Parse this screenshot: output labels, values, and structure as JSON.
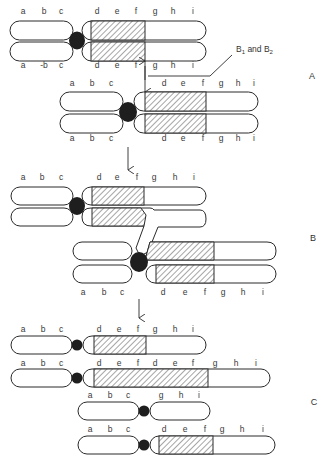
{
  "figure": {
    "sections": [
      {
        "id": "A",
        "label": "A",
        "x": 312,
        "y": 76
      },
      {
        "id": "B",
        "label": "B",
        "x": 313,
        "y": 238
      },
      {
        "id": "C",
        "label": "C",
        "x": 314,
        "y": 402
      }
    ],
    "callout": {
      "text": "B",
      "sub1": "1",
      "mid": " and B",
      "sub2": "2"
    },
    "colors": {
      "outline": "#2a2a2a",
      "centromere": "#1e1e1e",
      "background": "#ffffff",
      "text": "#3a3a3a"
    },
    "gene_rows": [
      {
        "name": "A-top-upper",
        "y": 14,
        "labels": [
          [
            "a",
            23
          ],
          [
            "b",
            44
          ],
          [
            "c",
            61
          ],
          [
            "d",
            97
          ],
          [
            "e",
            117
          ],
          [
            "f",
            136
          ],
          [
            "g",
            155
          ],
          [
            "h",
            173
          ],
          [
            "i",
            193
          ]
        ]
      },
      {
        "name": "A-top-lower",
        "y": 68,
        "labels": [
          [
            "a",
            23
          ],
          [
            "-b",
            44
          ],
          [
            "c",
            61
          ],
          [
            "d",
            97
          ],
          [
            "e",
            117
          ],
          [
            "f",
            136
          ],
          [
            "g",
            155
          ],
          [
            "h",
            173
          ],
          [
            "i",
            193
          ]
        ]
      },
      {
        "name": "A-second-upper",
        "y": 86,
        "labels": [
          [
            "a",
            72
          ],
          [
            "b",
            92
          ],
          [
            "c",
            111
          ],
          [
            "d",
            164
          ],
          [
            "e",
            183
          ],
          [
            "f",
            203
          ],
          [
            "g",
            221
          ],
          [
            "h",
            238
          ],
          [
            "i",
            254
          ]
        ]
      },
      {
        "name": "A-second-lower",
        "y": 141,
        "labels": [
          [
            "a",
            72
          ],
          [
            "b",
            92
          ],
          [
            "c",
            111
          ],
          [
            "d",
            164
          ],
          [
            "e",
            183
          ],
          [
            "f",
            203
          ],
          [
            "g",
            221
          ],
          [
            "h",
            238
          ],
          [
            "i",
            254
          ]
        ]
      },
      {
        "name": "B-upper",
        "y": 180,
        "labels": [
          [
            "a",
            23
          ],
          [
            "b",
            42
          ],
          [
            "c",
            61
          ],
          [
            "d",
            99
          ],
          [
            "e",
            117
          ],
          [
            "f",
            137
          ],
          [
            "g",
            154
          ],
          [
            "h",
            175
          ],
          [
            "i",
            194
          ]
        ]
      },
      {
        "name": "B-lower",
        "y": 295,
        "labels": [
          [
            "a",
            83
          ],
          [
            "b",
            104
          ],
          [
            "c",
            122
          ],
          [
            "d",
            163
          ],
          [
            "e",
            185
          ],
          [
            "f",
            205
          ],
          [
            "g",
            223
          ],
          [
            "h",
            243
          ],
          [
            "i",
            263
          ]
        ]
      },
      {
        "name": "C-1",
        "y": 332,
        "labels": [
          [
            "a",
            23
          ],
          [
            "b",
            43
          ],
          [
            "c",
            61
          ],
          [
            "d",
            99
          ],
          [
            "e",
            119
          ],
          [
            "f",
            138
          ],
          [
            "g",
            155
          ],
          [
            "h",
            175
          ],
          [
            "i",
            193
          ]
        ]
      },
      {
        "name": "C-2",
        "y": 366,
        "labels": [
          [
            "a",
            23
          ],
          [
            "b",
            43
          ],
          [
            "c",
            61
          ],
          [
            "d",
            99
          ],
          [
            "e",
            119
          ],
          [
            "f",
            138
          ],
          [
            "d",
            155
          ],
          [
            "e",
            175
          ],
          [
            "f",
            193
          ],
          [
            "g",
            215
          ],
          [
            "h",
            236
          ],
          [
            "i",
            256
          ]
        ]
      },
      {
        "name": "C-3",
        "y": 398,
        "labels": [
          [
            "a",
            90
          ],
          [
            "b",
            110
          ],
          [
            "c",
            128
          ],
          [
            "g",
            161
          ],
          [
            "h",
            181
          ],
          [
            "i",
            199
          ]
        ]
      },
      {
        "name": "C-4",
        "y": 432,
        "labels": [
          [
            "a",
            90
          ],
          [
            "b",
            110
          ],
          [
            "c",
            128
          ],
          [
            "d",
            164
          ],
          [
            "e",
            185
          ],
          [
            "f",
            205
          ],
          [
            "g",
            222
          ],
          [
            "h",
            242
          ],
          [
            "i",
            263
          ]
        ]
      }
    ]
  }
}
